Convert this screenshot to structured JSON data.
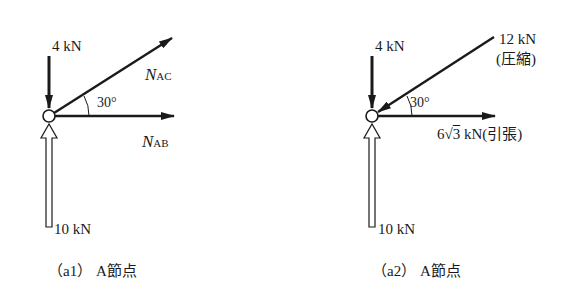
{
  "panels": [
    {
      "id": "a1",
      "caption": "（a1） A節点",
      "load_top": "4 kN",
      "load_bottom": "10 kN",
      "angle": "30°",
      "member_inclined": {
        "symbol": "N",
        "subscript": "AC"
      },
      "member_horizontal": {
        "symbol": "N",
        "subscript": "AB"
      }
    },
    {
      "id": "a2",
      "caption": "（a2） A節点",
      "load_top": "4 kN",
      "load_bottom": "10 kN",
      "angle": "30°",
      "member_inclined": {
        "value": "12 kN",
        "state": "(圧縮)"
      },
      "member_horizontal": {
        "coef": "6",
        "radical": "3",
        "unit": "kN",
        "state": "(引張)"
      }
    }
  ],
  "colors": {
    "ink": "#1a1a1a",
    "background": "#ffffff"
  }
}
